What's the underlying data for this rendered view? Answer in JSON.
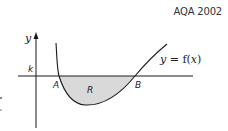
{
  "source_label": "AQA 2002",
  "diagram": {
    "axis_y_label": "y",
    "line_label": "k",
    "point_a_label": "A",
    "point_b_label": "B",
    "region_label": "R",
    "curve_label_y": "y",
    "curve_label_eq": " = f(",
    "curve_label_x": "x",
    "curve_label_close": ")",
    "colors": {
      "stroke": "#1a1a1a",
      "shade": "#d9d9d9"
    }
  }
}
